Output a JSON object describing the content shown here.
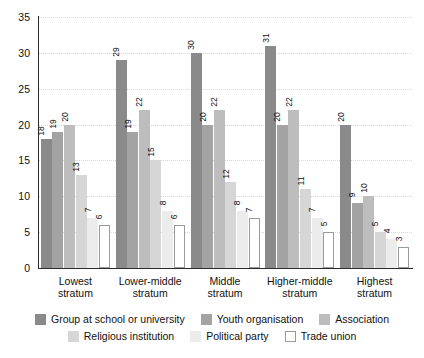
{
  "chart_data": {
    "type": "bar",
    "title": "",
    "subtitle": "",
    "xlabel": "",
    "ylabel": "",
    "ylim": [
      0,
      35
    ],
    "yticks": [
      0,
      5,
      10,
      15,
      20,
      25,
      30,
      35
    ],
    "grid": true,
    "legend_position": "bottom",
    "categories": [
      "Lowest stratum",
      "Lower-middle stratum",
      "Middle stratum",
      "Higher-middle stratum",
      "Highest stratum"
    ],
    "category_lines": [
      [
        "Lowest",
        "stratum"
      ],
      [
        "Lower-middle",
        "stratum"
      ],
      [
        "Middle",
        "stratum"
      ],
      [
        "Higher-middle",
        "stratum"
      ],
      [
        "Highest",
        "stratum"
      ]
    ],
    "series": [
      {
        "name": "Group at school or university",
        "color": "#8a8a8a",
        "border": "#8a8a8a",
        "values": [
          18,
          29,
          30,
          31,
          20
        ]
      },
      {
        "name": "Youth organisation",
        "color": "#a3a3a3",
        "border": "#a3a3a3",
        "values": [
          19,
          19,
          20,
          20,
          9
        ]
      },
      {
        "name": "Association",
        "color": "#bdbdbd",
        "border": "#bdbdbd",
        "values": [
          20,
          22,
          22,
          22,
          10
        ]
      },
      {
        "name": "Religious institution",
        "color": "#d6d6d6",
        "border": "#d6d6d6",
        "values": [
          13,
          15,
          12,
          11,
          5
        ]
      },
      {
        "name": "Political party",
        "color": "#ececec",
        "border": "#ececec",
        "values": [
          7,
          8,
          8,
          7,
          4
        ]
      },
      {
        "name": "Trade union",
        "color": "#ffffff",
        "border": "#9a9a9a",
        "values": [
          6,
          6,
          7,
          5,
          3
        ]
      }
    ]
  },
  "legend": {
    "row1": [
      "Group at school or university",
      "Youth organisation",
      "Association"
    ],
    "row2": [
      "Religious institution",
      "Political party",
      "Trade union"
    ]
  }
}
